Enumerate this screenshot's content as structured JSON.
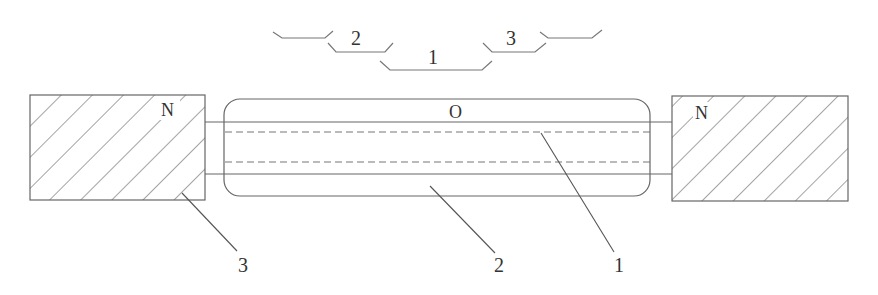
{
  "diagram": {
    "type": "schematic cross-section",
    "colors": {
      "stroke": "#555555",
      "text": "#333333",
      "background": "#ffffff"
    },
    "bracket_labels": {
      "left": "2",
      "center": "1",
      "right": "3"
    },
    "region_labels": {
      "left_block": "N",
      "right_block": "N",
      "center_top": "O"
    },
    "callouts": [
      {
        "label": "3",
        "target": "left hatched block"
      },
      {
        "label": "2",
        "target": "outer rounded capsule"
      },
      {
        "label": "1",
        "target": "inner core between solid lines"
      }
    ]
  }
}
